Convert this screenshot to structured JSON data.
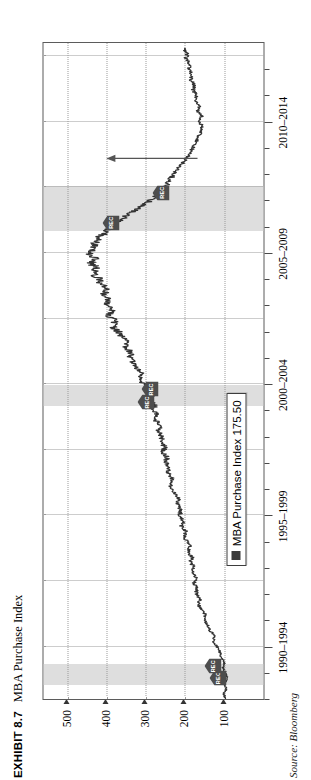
{
  "exhibit": {
    "label": "EXHIBIT 8.7",
    "title": "MBA Purchase Index"
  },
  "source": {
    "label": "Source:",
    "value": "Bloomberg",
    "full": "Source: Bloomberg"
  },
  "legend": {
    "swatch_color": "#3a3a3a",
    "text": "MBA Purchase Index 175.50"
  },
  "markers": {
    "rec_label": "REC",
    "rec_color": "#4d4d4d"
  },
  "chart_data": {
    "type": "line",
    "title": "MBA Purchase Index",
    "xlabel": "",
    "ylabel": "",
    "ylim": [
      0,
      560
    ],
    "xlim": [
      1990,
      2015
    ],
    "grid": true,
    "legend_position": "bottom-left",
    "y_ticks": [
      500,
      400,
      300,
      200,
      100
    ],
    "y_tick_labels": [
      "500",
      "400",
      "300",
      "200",
      "100"
    ],
    "x_ticks": [
      1992,
      1997,
      2002,
      2007,
      2012
    ],
    "x_tick_labels": [
      "1990–1994",
      "1995–1999",
      "2000–2004",
      "2005–2009",
      "2010–2014"
    ],
    "x_minor_ticks": [
      1990,
      1991,
      1993,
      1994,
      1995,
      1996,
      1998,
      1999,
      2000,
      2001,
      2003,
      2004,
      2005,
      2006,
      2008,
      2009,
      2010,
      2011,
      2013,
      2014
    ],
    "series": [
      {
        "name": "MBA Purchase Index",
        "color": "#333333",
        "last_value": 175.5,
        "x": [
          1990.0,
          1990.2,
          1990.4,
          1990.6,
          1990.8,
          1991.0,
          1991.2,
          1991.4,
          1991.6,
          1991.8,
          1992.0,
          1992.2,
          1992.4,
          1992.6,
          1992.8,
          1993.0,
          1993.2,
          1993.4,
          1993.6,
          1993.8,
          1994.0,
          1994.2,
          1994.4,
          1994.6,
          1994.8,
          1995.0,
          1995.2,
          1995.4,
          1995.6,
          1995.8,
          1996.0,
          1996.2,
          1996.4,
          1996.6,
          1996.8,
          1997.0,
          1997.2,
          1997.4,
          1997.6,
          1997.8,
          1998.0,
          1998.2,
          1998.4,
          1998.6,
          1998.8,
          1999.0,
          1999.2,
          1999.4,
          1999.6,
          1999.8,
          2000.0,
          2000.2,
          2000.4,
          2000.6,
          2000.8,
          2001.0,
          2001.2,
          2001.4,
          2001.6,
          2001.8,
          2002.0,
          2002.2,
          2002.4,
          2002.6,
          2002.8,
          2003.0,
          2003.2,
          2003.4,
          2003.6,
          2003.8,
          2004.0,
          2004.2,
          2004.4,
          2004.6,
          2004.8,
          2005.0,
          2005.2,
          2005.4,
          2005.6,
          2005.8,
          2006.0,
          2006.2,
          2006.4,
          2006.6,
          2006.8,
          2007.0,
          2007.2,
          2007.4,
          2007.6,
          2007.8,
          2008.0,
          2008.2,
          2008.4,
          2008.6,
          2008.8,
          2009.0,
          2009.2,
          2009.4,
          2009.6,
          2009.8,
          2010.0,
          2010.2,
          2010.4,
          2010.6,
          2010.8,
          2011.0,
          2011.2,
          2011.4,
          2011.6,
          2011.8,
          2012.0,
          2012.2,
          2012.4,
          2012.6,
          2012.8,
          2013.0,
          2013.2,
          2013.4,
          2013.6,
          2013.8,
          2014.0,
          2014.2,
          2014.4,
          2014.6,
          2014.8
        ],
        "y": [
          96,
          101,
          94,
          99,
          92,
          97,
          103,
          99,
          107,
          112,
          118,
          128,
          124,
          136,
          142,
          151,
          147,
          158,
          166,
          161,
          172,
          168,
          177,
          171,
          182,
          176,
          186,
          181,
          191,
          187,
          196,
          203,
          198,
          208,
          204,
          214,
          209,
          219,
          215,
          224,
          230,
          238,
          233,
          244,
          239,
          249,
          245,
          256,
          251,
          262,
          258,
          268,
          263,
          274,
          270,
          281,
          277,
          288,
          284,
          296,
          304,
          315,
          309,
          322,
          330,
          342,
          336,
          352,
          345,
          362,
          370,
          385,
          376,
          392,
          386,
          398,
          392,
          406,
          399,
          412,
          419,
          431,
          424,
          438,
          430,
          445,
          436,
          428,
          418,
          402,
          388,
          368,
          352,
          330,
          308,
          288,
          272,
          258,
          246,
          238,
          228,
          218,
          206,
          196,
          188,
          180,
          172,
          166,
          160,
          156,
          162,
          158,
          168,
          164,
          174,
          170,
          180,
          176,
          186,
          182,
          192,
          188,
          198,
          194,
          202
        ]
      }
    ],
    "recession_bands": [
      {
        "start": 1990.55,
        "end": 1991.35,
        "color": "#dedede",
        "label": "REC"
      },
      {
        "start": 2001.15,
        "end": 2001.95,
        "color": "#dedede",
        "label": "REC"
      },
      {
        "start": 2007.85,
        "end": 2009.55,
        "color": "#dedede",
        "label": "REC"
      }
    ],
    "rec_markers": [
      {
        "x": 1990.8,
        "y": 118,
        "label": "REC"
      },
      {
        "x": 1991.25,
        "y": 130,
        "label": "REC"
      },
      {
        "x": 2001.3,
        "y": 300,
        "label": "REC"
      },
      {
        "x": 2001.8,
        "y": 290,
        "label": "REC"
      },
      {
        "x": 2008.15,
        "y": 390,
        "label": "REC"
      },
      {
        "x": 2009.3,
        "y": 262,
        "label": "REC"
      }
    ],
    "annotations": [
      {
        "type": "arrow",
        "x_start": 2010.6,
        "y_start": 168,
        "x_end": 2010.6,
        "y_end": 400,
        "note": "upward trend arrow"
      }
    ]
  }
}
